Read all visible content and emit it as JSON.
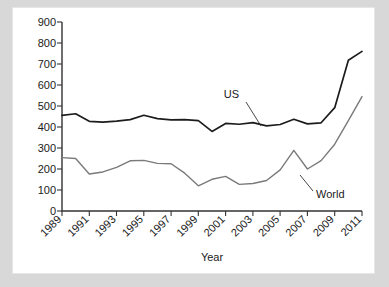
{
  "chart_data": {
    "type": "line",
    "title": "",
    "xlabel": "Year",
    "ylabel": "",
    "grid": false,
    "legend_position": "inline-annotation",
    "xlim": [
      1989,
      2011
    ],
    "ylim": [
      0,
      900
    ],
    "ytick_values": [
      0,
      100,
      200,
      300,
      400,
      500,
      600,
      700,
      800,
      900
    ],
    "ytick_labels": [
      "0",
      "100",
      "200",
      "300",
      "400",
      "500",
      "600",
      "700",
      "800",
      "900"
    ],
    "xtick_values": [
      1989,
      1991,
      1993,
      1995,
      1997,
      1999,
      2001,
      2003,
      2005,
      2007,
      2009,
      2011
    ],
    "xtick_labels": [
      "1989",
      "1991",
      "1993",
      "1995",
      "1997",
      "1999",
      "2001",
      "2003",
      "2005",
      "2007",
      "2009",
      "2011"
    ],
    "x": [
      1989,
      1990,
      1991,
      1992,
      1993,
      1994,
      1995,
      1996,
      1997,
      1998,
      1999,
      2000,
      2001,
      2002,
      2003,
      2004,
      2005,
      2006,
      2007,
      2008,
      2009,
      2010,
      2011
    ],
    "series": [
      {
        "name": "US",
        "color": "#1c1c1c",
        "values": [
          455,
          463,
          427,
          423,
          428,
          435,
          456,
          440,
          434,
          435,
          430,
          379,
          417,
          413,
          421,
          405,
          412,
          437,
          415,
          420,
          492,
          718,
          760
        ]
      },
      {
        "name": "World",
        "color": "#7a7a7a",
        "values": [
          254,
          250,
          176,
          186,
          208,
          239,
          241,
          227,
          225,
          180,
          120,
          151,
          165,
          127,
          131,
          145,
          196,
          289,
          200,
          240,
          318,
          430,
          545
        ]
      }
    ],
    "annotations": [
      {
        "text": "US",
        "series": "US"
      },
      {
        "text": "World",
        "series": "World"
      }
    ]
  }
}
